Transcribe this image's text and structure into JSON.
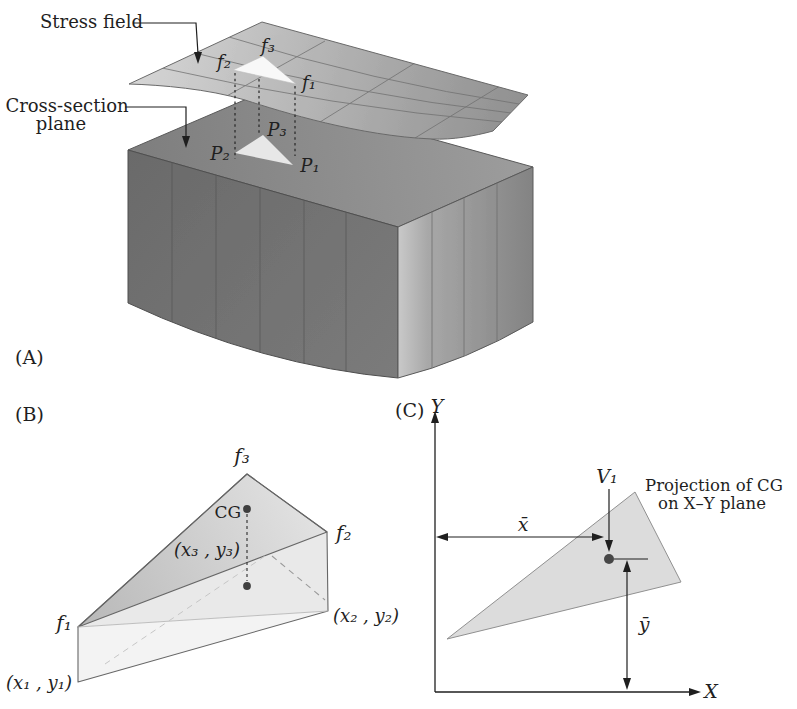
{
  "panels": {
    "a": {
      "panel_label": "(A)",
      "stress_field": "Stress field",
      "cross_section_1": "Cross-section",
      "cross_section_2": "plane",
      "f1": "f₁",
      "f2": "f₂",
      "f3": "f₃",
      "p1": "P₁",
      "p2": "P₂",
      "p3": "P₃"
    },
    "b": {
      "panel_label": "(B)",
      "f1": "f₁",
      "f2": "f₂",
      "f3": "f₃",
      "cg": "CG",
      "xy1": "(x₁ , y₁)",
      "xy2": "(x₂ , y₂)",
      "xy3": "(x₃ , y₃)"
    },
    "c": {
      "panel_label": "(C)",
      "y_axis": "Y",
      "x_axis": "X",
      "v1": "V₁",
      "xbar": "x̄",
      "ybar": "ȳ",
      "projection_1": "Projection of CG",
      "projection_2": "on X–Y plane"
    }
  },
  "colors": {
    "ink": "#1f1f1f",
    "sheet_light": "#d8d8d8",
    "sheet_dark": "#8f8f8f",
    "block_top_light": "#9c9c9c",
    "block_top_dark": "#828282",
    "block_front": "#6b6b6b",
    "block_right_highlight": "#c7c7c7",
    "block_right_dark": "#858585",
    "wedge_top_dark": "#bcbcbc",
    "wedge_top_light": "#e2e2e2",
    "wedge_front": "#eaeaea",
    "projection_triangle": "#dcdcdc",
    "dot": "#3f3f3f"
  }
}
